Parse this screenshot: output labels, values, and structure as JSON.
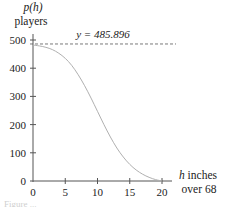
{
  "chart_data": {
    "type": "line",
    "title": "",
    "xlabel": "h inches over 68",
    "xlabel_lines": [
      "h inches",
      "over 68"
    ],
    "ylabel": "p(h) players",
    "ylabel_lines": [
      "p(h)",
      "players"
    ],
    "xlim": [
      0,
      21
    ],
    "ylim": [
      0,
      510
    ],
    "x_ticks": [
      0,
      5,
      10,
      15,
      20
    ],
    "y_ticks": [
      0,
      100,
      200,
      300,
      400,
      500
    ],
    "grid": false,
    "legend": null,
    "asymptote": {
      "y": 485.896,
      "label": "y = 485.896",
      "style": "dashed"
    },
    "series": [
      {
        "name": "p(h)",
        "x": [
          0,
          1,
          2,
          3,
          4,
          5,
          6,
          7,
          8,
          9,
          10,
          11,
          12,
          13,
          14,
          15,
          16,
          17,
          18,
          19,
          20
        ],
        "values": [
          482,
          479,
          474,
          466,
          453,
          435,
          410,
          377,
          338,
          294,
          247,
          200,
          156,
          117,
          85,
          59,
          39,
          24,
          13,
          5,
          0
        ]
      }
    ]
  },
  "labels": {
    "y_title_1": "p(h)",
    "y_title_2": "players",
    "x_title_1": "h inches",
    "x_title_2": "over 68",
    "asymptote": "y = 485.896",
    "caption": "Figure ..."
  }
}
